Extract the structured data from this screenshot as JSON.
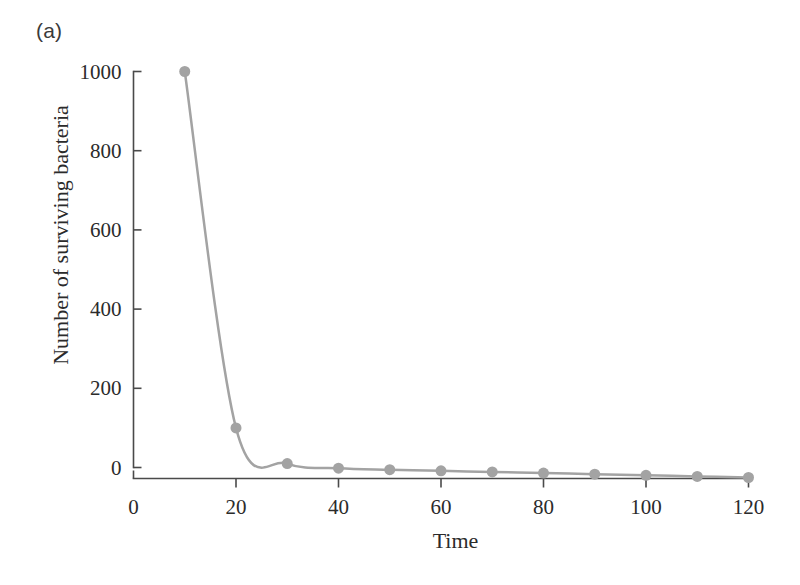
{
  "figure": {
    "panel_label": "(a)",
    "background_color": "#ffffff",
    "axis_color": "#4a4a4a",
    "series_color": "#a3a3a3",
    "text_color": "#2b2b2b"
  },
  "chart_data": {
    "type": "line",
    "title": "",
    "subtitle": "",
    "panel": "(a)",
    "xlabel": "Time",
    "ylabel": "Number of surviving bacteria",
    "xlim": [
      0,
      120
    ],
    "ylim": [
      0,
      1000
    ],
    "xticks": [
      0,
      20,
      40,
      60,
      80,
      100,
      120
    ],
    "xtick_labels": [
      "0",
      "20",
      "40",
      "60",
      "80",
      "100",
      "120"
    ],
    "yticks": [
      0,
      200,
      400,
      600,
      800,
      1000
    ],
    "ytick_labels": [
      "0",
      "200",
      "400",
      "600",
      "800",
      "1000"
    ],
    "grid": false,
    "legend": null,
    "marker": "circle",
    "marker_size": 11,
    "line_width": 2.5,
    "series": [
      {
        "name": "Surviving bacteria",
        "x": [
          10,
          20,
          30,
          40,
          50,
          60,
          70,
          80,
          90,
          100,
          110,
          120
        ],
        "y": [
          1000,
          100,
          10,
          1,
          0,
          0,
          0,
          0,
          0,
          0,
          0,
          0
        ]
      }
    ],
    "annotations": []
  }
}
